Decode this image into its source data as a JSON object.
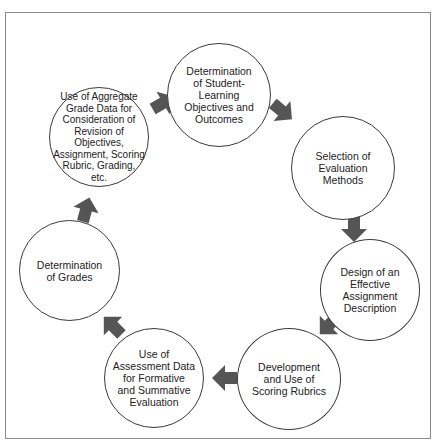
{
  "diagram": {
    "type": "cycle",
    "colors": {
      "arrow": "#555555",
      "circle_border": "#3a3a3a",
      "frame": "#8a8a8a",
      "text": "#222222"
    },
    "nodes": [
      {
        "id": "n1",
        "label": "Determination\nof Student-\nLearning\nObjectives and\nOutcomes"
      },
      {
        "id": "n2",
        "label": "Selection of\nEvaluation\nMethods"
      },
      {
        "id": "n3",
        "label": "Design of an\nEffective\nAssignment\nDescription"
      },
      {
        "id": "n4",
        "label": "Development\nand Use of\nScoring Rubrics"
      },
      {
        "id": "n5",
        "label": "Use of\nAssessment Data\nfor Formative\nand Summative\nEvaluation"
      },
      {
        "id": "n6",
        "label": "Determination\nof Grades"
      },
      {
        "id": "n7",
        "label": "Use of Aggregate\nGrade Data for\nConsideration of\nRevision of Objectives,\nAssignment, Scoring\nRubric, Grading,\netc."
      }
    ],
    "edges": [
      {
        "from": "n1",
        "to": "n2"
      },
      {
        "from": "n2",
        "to": "n3"
      },
      {
        "from": "n3",
        "to": "n4"
      },
      {
        "from": "n4",
        "to": "n5"
      },
      {
        "from": "n5",
        "to": "n6"
      },
      {
        "from": "n6",
        "to": "n7"
      },
      {
        "from": "n7",
        "to": "n1"
      }
    ]
  }
}
